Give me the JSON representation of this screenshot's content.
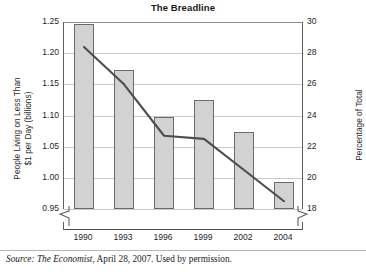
{
  "chart_data": {
    "type": "bar",
    "title": "The Breadline",
    "xlabel": "",
    "ylabel": "People Living on Less Than $1 per Day (billions)",
    "ylabel_right": "Percentage of Total",
    "categories": [
      "1990",
      "1993",
      "1996",
      "1999",
      "2002",
      "2004"
    ],
    "ylim": [
      0.95,
      1.25
    ],
    "ylim_right": [
      18,
      30
    ],
    "yticks": [
      "1.25",
      "1.20",
      "1.15",
      "1.10",
      "1.05",
      "1.00",
      "0.95"
    ],
    "ytick_values": [
      1.25,
      1.2,
      1.15,
      1.1,
      1.05,
      1.0,
      0.95
    ],
    "yticks_right": [
      "30",
      "28",
      "26",
      "24",
      "22",
      "20",
      "18"
    ],
    "ytick_values_right": [
      30,
      28,
      26,
      24,
      22,
      20,
      18
    ],
    "grid": true,
    "legend": "none",
    "axis_break": true,
    "series": [
      {
        "name": "People Living on Less Than $1 per Day (billions)",
        "kind": "bar",
        "axis": "left",
        "values": [
          1.247,
          1.173,
          1.097,
          1.125,
          1.074,
          0.993
        ],
        "color": "#d2d2d2",
        "edge_color": "#6a6a6a"
      },
      {
        "name": "Percentage of Total",
        "kind": "line",
        "axis": "right",
        "values": [
          28.4,
          26.0,
          22.7,
          22.5,
          20.5,
          18.5
        ],
        "color": "#4d4d4d"
      }
    ]
  },
  "title": {
    "text": "The Breadline"
  },
  "axes": {
    "left_title_line1": "People Living on Less Than",
    "left_title_line2": "$1 per Day (billions)",
    "right_title": "Percentage of Total"
  },
  "source": {
    "prefix": "Source:",
    "publication": "The Economist",
    "rest": ", April 28, 2007. Used by permission."
  }
}
